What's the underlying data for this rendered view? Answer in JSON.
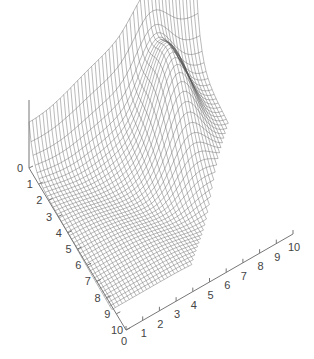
{
  "chart_data": {
    "type": "surface",
    "title": "",
    "xlabel": "",
    "ylabel": "",
    "zlabel": "",
    "x_ticks": [
      "0",
      "1",
      "2",
      "3",
      "4",
      "5",
      "6",
      "7",
      "8",
      "9",
      "10"
    ],
    "y_ticks": [
      "0",
      "1",
      "2",
      "3",
      "4",
      "5",
      "6",
      "7",
      "8",
      "9",
      "10"
    ],
    "z_ticks": [
      "0"
    ],
    "x_range": [
      0,
      10
    ],
    "y_range": [
      0,
      10
    ],
    "grid_resolution": 48,
    "peak": {
      "x": 7,
      "y": 2,
      "z_relative": "max"
    },
    "mesh_color": "#555555",
    "axis_color": "#777777"
  }
}
